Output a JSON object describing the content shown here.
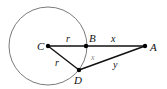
{
  "diagram": {
    "type": "geometry",
    "circle": {
      "center_label": "C",
      "cx": 48,
      "cy": 46,
      "r": 39,
      "color": "#7a7a7a"
    },
    "points": {
      "C": {
        "label": "C",
        "x": 48,
        "y": 46
      },
      "B": {
        "label": "B",
        "x": 86,
        "y": 46
      },
      "A": {
        "label": "A",
        "x": 145,
        "y": 46
      },
      "D": {
        "label": "D",
        "x": 79,
        "y": 70
      }
    },
    "segments": [
      {
        "from": "C",
        "to": "B",
        "label": "r"
      },
      {
        "from": "B",
        "to": "A",
        "label": "x"
      },
      {
        "from": "C",
        "to": "D",
        "label": "r"
      },
      {
        "from": "D",
        "to": "A",
        "label": "y"
      },
      {
        "from": "B",
        "to": "D",
        "label": "x",
        "style": "arc-label-gray"
      }
    ],
    "labels": {
      "C": "C",
      "B": "B",
      "A": "A",
      "D": "D",
      "r_top": "r",
      "x_top": "x",
      "r_left": "r",
      "x_arc": "x",
      "y": "y"
    },
    "colors": {
      "line": "#111111",
      "circle": "#7a7a7a",
      "point": "#000000",
      "arc_label": "#8a8a8a"
    }
  }
}
